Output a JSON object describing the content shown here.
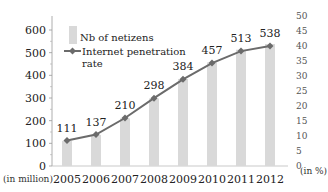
{
  "chart_data": {
    "type": "bar",
    "title": "",
    "categories": [
      "2005",
      "2006",
      "2007",
      "2008",
      "2009",
      "2010",
      "2011",
      "2012"
    ],
    "series": [
      {
        "name": "Nb of netizens",
        "type": "bar",
        "axis": "left",
        "color": "#d9d9d9",
        "values": [
          111,
          137,
          210,
          298,
          384,
          457,
          513,
          538
        ],
        "labels": [
          "111",
          "137",
          "210",
          "298",
          "384",
          "457",
          "513",
          "538"
        ]
      },
      {
        "name": "Internet penetration rate",
        "type": "line",
        "axis": "right",
        "color": "#6b6b6b",
        "values": [
          8.5,
          10.5,
          16.0,
          22.6,
          28.9,
          34.3,
          38.3,
          40.0
        ]
      }
    ],
    "xlabel": "",
    "ylabel": "(in million)",
    "y2label": "(in %)",
    "ylim": [
      0,
      600
    ],
    "y2lim": [
      0,
      50
    ],
    "yticks": [
      "0",
      "100",
      "200",
      "300",
      "400",
      "500",
      "600"
    ],
    "y2ticks": [
      "0",
      "5",
      "10",
      "15",
      "20",
      "25",
      "30",
      "35",
      "40",
      "45",
      "50"
    ],
    "grid": false,
    "legend": {
      "position": "top-left-inside",
      "entries": [
        "Nb of netizens",
        "Internet penetration",
        "rate"
      ]
    }
  },
  "axes": {
    "left_unit": "(in million)",
    "right_unit": "(in %)"
  },
  "legend": {
    "bar_label": "Nb of netizens",
    "line_label_1": "Internet penetration",
    "line_label_2": "rate"
  }
}
